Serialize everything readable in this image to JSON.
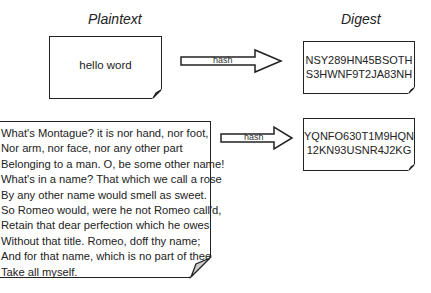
{
  "diagram": {
    "columns": {
      "left_title": "Plaintext",
      "right_title": "Digest"
    },
    "rows": [
      {
        "plaintext": "hello word",
        "arrow_label": "hash",
        "digest_lines": [
          "NSY289HN45BSOTH",
          "S3HWNF9T2JA83NH"
        ]
      },
      {
        "plaintext_lines": [
          "What's Montague? it is nor hand, nor foot,",
          "Nor arm, nor face, nor any other part",
          "Belonging to a man. O, be some other name!",
          "What's in a name? That which we call a rose",
          "By any other name would smell as sweet.",
          "So Romeo would, were he not Romeo call'd,",
          "Retain that dear perfection which he owes",
          "Without that title. Romeo, doff thy name;",
          "And for that name, which is no part of thee",
          "Take all myself."
        ],
        "arrow_label": "hash",
        "digest_lines": [
          "YQNFO630T1M9HQN",
          "12KN93USNR4J2KG"
        ]
      }
    ]
  }
}
